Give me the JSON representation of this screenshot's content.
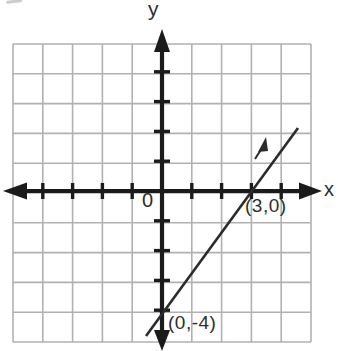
{
  "figure": {
    "y_axis_label": "y",
    "x_axis_label": "x",
    "origin_label": "0",
    "x_intercept_label": "(3,0)",
    "y_intercept_label": "(0,-4)"
  },
  "colors": {
    "axis": "#1b1b1b",
    "grid": "#b1b1b1",
    "line": "#2b2b2b",
    "text": "#2e2e2e",
    "background": "#ffffff"
  },
  "chart_data": {
    "type": "line",
    "title": "",
    "xlabel": "x",
    "ylabel": "y",
    "xlim": [
      -5,
      5
    ],
    "ylim": [
      -5,
      5
    ],
    "grid": true,
    "grid_step": 1,
    "legend": false,
    "series": [
      {
        "name": "plotted-line",
        "equation": "y = (4/3)x - 4",
        "slope": 1.3333,
        "x_intercept": 3,
        "y_intercept": -4,
        "labeled_points": [
          {
            "x": 3,
            "y": 0,
            "label": "(3,0)"
          },
          {
            "x": 0,
            "y": -4,
            "label": "(0,-4)"
          }
        ],
        "segment_drawn": {
          "from": {
            "x": -0.55,
            "y": -4.85
          },
          "to": {
            "x": 4.55,
            "y": 2.1
          }
        }
      }
    ]
  }
}
